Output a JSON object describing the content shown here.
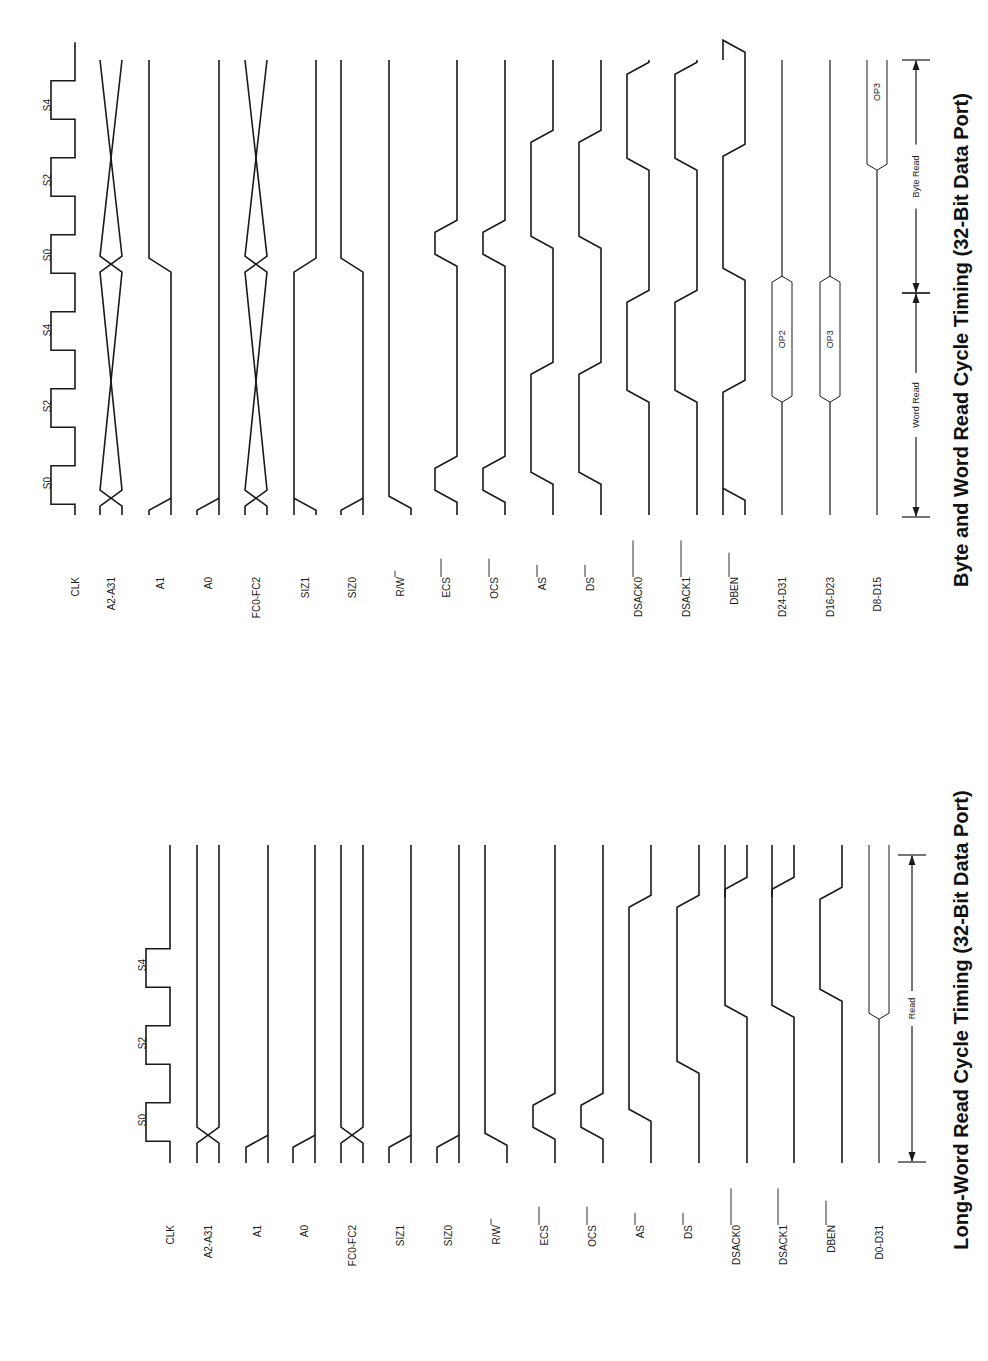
{
  "page": {
    "background": "#ffffff",
    "ink": "#1a1a1a",
    "orientation": "rotated-90-ccw"
  },
  "diagrams": [
    {
      "id": "byte-word",
      "title": "Byte and Word Read Cycle Timing (32-Bit Data Port)",
      "title_x": 968,
      "title_y": 340,
      "t_bottom": 515,
      "t_top": 60,
      "clock_states": [
        {
          "label": "S0",
          "y": 483
        },
        {
          "label": "S2",
          "y": 406
        },
        {
          "label": "S4",
          "y": 330
        },
        {
          "label": "S0",
          "y": 255
        },
        {
          "label": "S2",
          "y": 180
        },
        {
          "label": "S4",
          "y": 105
        }
      ],
      "signals": [
        {
          "name": "CLK",
          "overbar": "",
          "x": 75
        },
        {
          "name": "A2-A31",
          "overbar": "",
          "x": 111
        },
        {
          "name": "A1",
          "overbar": "",
          "x": 160
        },
        {
          "name": "A0",
          "overbar": "",
          "x": 208
        },
        {
          "name": "FC0-FC2",
          "overbar": "",
          "x": 256
        },
        {
          "name": "SIZ1",
          "overbar": "",
          "x": 305
        },
        {
          "name": "SIZ0",
          "overbar": "",
          "x": 352
        },
        {
          "name": "R/W",
          "overbar": "W",
          "x": 400
        },
        {
          "name": "ECS",
          "overbar": "ECS",
          "x": 446
        },
        {
          "name": "OCS",
          "overbar": "OCS",
          "x": 494
        },
        {
          "name": "AS",
          "overbar": "AS",
          "x": 542
        },
        {
          "name": "DS",
          "overbar": "DS",
          "x": 590
        },
        {
          "name": "DSACK0",
          "overbar": "DSACK0",
          "x": 638
        },
        {
          "name": "DSACK1",
          "overbar": "DSACK1",
          "x": 686
        },
        {
          "name": "DBEN",
          "overbar": "DBEN",
          "x": 734
        },
        {
          "name": "D24-D31",
          "overbar": "",
          "x": 782
        },
        {
          "name": "D16-D23",
          "overbar": "",
          "x": 830
        },
        {
          "name": "D8-D15",
          "overbar": "",
          "x": 877
        }
      ],
      "data_values": [
        {
          "signal": "D24-D31",
          "label": "OP2"
        },
        {
          "signal": "D16-D23",
          "label": "OP3"
        },
        {
          "signal": "D8-D15",
          "label": "OP3"
        }
      ],
      "annotations": [
        {
          "label": "Word Read",
          "from_y": 517,
          "to_y": 293
        },
        {
          "label": "Byte Read",
          "from_y": 293,
          "to_y": 60
        }
      ]
    },
    {
      "id": "long-word",
      "title": "Long-Word Read Cycle Timing (32-Bit Data Port)",
      "title_x": 968,
      "title_y": 1020,
      "t_bottom": 1163,
      "t_top": 845,
      "clock_states": [
        {
          "label": "S0",
          "y": 1120
        },
        {
          "label": "S2",
          "y": 1043
        },
        {
          "label": "S4",
          "y": 965
        }
      ],
      "signals": [
        {
          "name": "CLK",
          "overbar": "",
          "x": 170
        },
        {
          "name": "A2-A31",
          "overbar": "",
          "x": 208
        },
        {
          "name": "A1",
          "overbar": "",
          "x": 257
        },
        {
          "name": "A0",
          "overbar": "",
          "x": 304
        },
        {
          "name": "FC0-FC2",
          "overbar": "",
          "x": 352
        },
        {
          "name": "SIZ1",
          "overbar": "",
          "x": 400
        },
        {
          "name": "SIZ0",
          "overbar": "",
          "x": 448
        },
        {
          "name": "R/W",
          "overbar": "W",
          "x": 496
        },
        {
          "name": "ECS",
          "overbar": "ECS",
          "x": 544
        },
        {
          "name": "OCS",
          "overbar": "OCS",
          "x": 592
        },
        {
          "name": "AS",
          "overbar": "AS",
          "x": 640
        },
        {
          "name": "DS",
          "overbar": "DS",
          "x": 688
        },
        {
          "name": "DSACK0",
          "overbar": "DSACK0",
          "x": 736
        },
        {
          "name": "DSACK1",
          "overbar": "DSACK1",
          "x": 783
        },
        {
          "name": "DBEN",
          "overbar": "DBEN",
          "x": 831
        },
        {
          "name": "D0-D31",
          "overbar": "",
          "x": 879
        }
      ],
      "data_values": [],
      "annotations": [
        {
          "label": "Read",
          "from_y": 1162,
          "to_y": 855
        }
      ]
    }
  ],
  "chart_data": {
    "type": "timing-diagram",
    "figures": [
      {
        "title": "Byte and Word Read Cycle Timing (32-Bit Data Port)",
        "clock_states": [
          "S0",
          "S2",
          "S4",
          "S0",
          "S2",
          "S4"
        ],
        "signals": [
          "CLK",
          "A2-A31",
          "A1",
          "A0",
          "FC0-FC2",
          "SIZ1",
          "SIZ0",
          "R/W",
          "ECS",
          "OCS",
          "AS",
          "DS",
          "DSACK0",
          "DSACK1",
          "DBEN",
          "D24-D31",
          "D16-D23",
          "D8-D15"
        ],
        "active_low": [
          "W",
          "ECS",
          "OCS",
          "AS",
          "DS",
          "DSACK0",
          "DSACK1",
          "DBEN"
        ],
        "data": {
          "D24-D31": "OP2 (word read)",
          "D16-D23": "OP3 (word read)",
          "D8-D15": "OP3 (byte read)"
        },
        "phases": [
          "Word Read",
          "Byte Read"
        ]
      },
      {
        "title": "Long-Word Read Cycle Timing (32-Bit Data Port)",
        "clock_states": [
          "S0",
          "S2",
          "S4"
        ],
        "signals": [
          "CLK",
          "A2-A31",
          "A1",
          "A0",
          "FC0-FC2",
          "SIZ1",
          "SIZ0",
          "R/W",
          "ECS",
          "OCS",
          "AS",
          "DS",
          "DSACK0",
          "DSACK1",
          "DBEN",
          "D0-D31"
        ],
        "active_low": [
          "W",
          "ECS",
          "OCS",
          "AS",
          "DS",
          "DSACK0",
          "DSACK1",
          "DBEN"
        ],
        "phases": [
          "Read"
        ]
      }
    ]
  }
}
